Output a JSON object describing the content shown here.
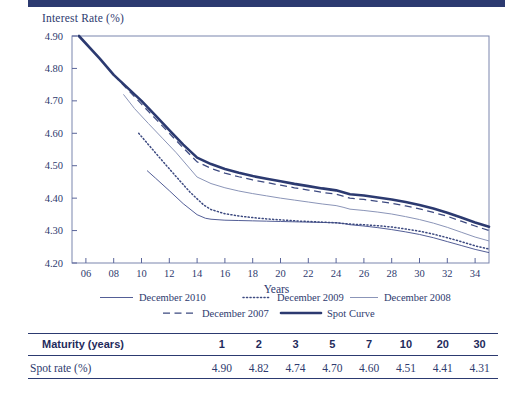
{
  "chart_data": {
    "type": "line",
    "title": "",
    "xlabel": "Years",
    "ylabel": "Interest Rate (%)",
    "xlim": [
      5,
      35
    ],
    "ylim": [
      4.2,
      4.9
    ],
    "grid": false,
    "legend_position": "bottom",
    "xticks": [
      "06",
      "08",
      "10",
      "12",
      "14",
      "16",
      "18",
      "20",
      "22",
      "24",
      "26",
      "28",
      "30",
      "32",
      "34"
    ],
    "xtick_values": [
      6,
      8,
      10,
      12,
      14,
      16,
      18,
      20,
      22,
      24,
      26,
      28,
      30,
      32,
      34
    ],
    "yticks": [
      "4.20",
      "4.30",
      "4.40",
      "4.50",
      "4.60",
      "4.70",
      "4.80",
      "4.90"
    ],
    "ytick_values": [
      4.2,
      4.3,
      4.4,
      4.5,
      4.6,
      4.7,
      4.8,
      4.9
    ],
    "series": [
      {
        "name": "Spot Curve",
        "style": "solid-thick",
        "color": "#2c3a70",
        "x": [
          5.5,
          7,
          8,
          9,
          10,
          11,
          12,
          13,
          14,
          15,
          16,
          17,
          18,
          19,
          20,
          21,
          22,
          23,
          24,
          24.5,
          25,
          26,
          27,
          28,
          29,
          30,
          31,
          32,
          33,
          34,
          35
        ],
        "y": [
          4.9,
          4.83,
          4.78,
          4.74,
          4.7,
          4.655,
          4.61,
          4.565,
          4.525,
          4.505,
          4.49,
          4.478,
          4.468,
          4.46,
          4.452,
          4.444,
          4.437,
          4.43,
          4.424,
          4.418,
          4.412,
          4.408,
          4.402,
          4.396,
          4.388,
          4.379,
          4.368,
          4.355,
          4.34,
          4.325,
          4.312
        ]
      },
      {
        "name": "December 2007",
        "style": "dashed",
        "color": "#3d4a80",
        "x": [
          8,
          9,
          10,
          11,
          12,
          13,
          14,
          15,
          16,
          17,
          18,
          19,
          20,
          21,
          22,
          23,
          24,
          24.5,
          25,
          26,
          27,
          28,
          29,
          30,
          31,
          32,
          33,
          34,
          35
        ],
        "y": [
          4.78,
          4.735,
          4.69,
          4.645,
          4.6,
          4.555,
          4.512,
          4.492,
          4.477,
          4.466,
          4.456,
          4.448,
          4.44,
          4.432,
          4.425,
          4.418,
          4.412,
          4.406,
          4.4,
          4.396,
          4.39,
          4.384,
          4.376,
          4.367,
          4.356,
          4.344,
          4.329,
          4.314,
          4.3
        ]
      },
      {
        "name": "December 2008",
        "style": "solid-thin-light",
        "color": "#8b95b8",
        "x": [
          8.7,
          9.5,
          10.5,
          11.5,
          12.5,
          13.5,
          14,
          15,
          16,
          17,
          18,
          19,
          20,
          21,
          22,
          23,
          24,
          24.5,
          25,
          26,
          27,
          28,
          29,
          30,
          31,
          32,
          33,
          34,
          35
        ],
        "y": [
          4.72,
          4.676,
          4.63,
          4.585,
          4.54,
          4.49,
          4.465,
          4.445,
          4.432,
          4.422,
          4.414,
          4.407,
          4.4,
          4.394,
          4.388,
          4.382,
          4.377,
          4.372,
          4.366,
          4.362,
          4.357,
          4.351,
          4.343,
          4.334,
          4.323,
          4.31,
          4.295,
          4.28,
          4.268
        ]
      },
      {
        "name": "December 2009",
        "style": "dotted",
        "color": "#3d4a80",
        "x": [
          9.8,
          10.5,
          11.5,
          12.5,
          13.5,
          14.5,
          15,
          16,
          17,
          18,
          19,
          20,
          21,
          22,
          23,
          24,
          24.5,
          25,
          26,
          27,
          28,
          29,
          30,
          31,
          32,
          33,
          34,
          35
        ],
        "y": [
          4.6,
          4.565,
          4.515,
          4.466,
          4.418,
          4.378,
          4.365,
          4.352,
          4.345,
          4.34,
          4.336,
          4.333,
          4.33,
          4.328,
          4.326,
          4.324,
          4.322,
          4.32,
          4.318,
          4.315,
          4.311,
          4.305,
          4.298,
          4.289,
          4.278,
          4.266,
          4.253,
          4.243
        ]
      },
      {
        "name": "December 2010",
        "style": "solid-thin",
        "color": "#4a5590",
        "x": [
          10.4,
          11,
          12,
          13,
          14,
          14.6,
          15,
          16,
          17,
          18,
          19,
          20,
          21,
          22,
          23,
          24,
          24.5,
          25,
          26,
          27,
          28,
          29,
          30,
          31,
          32,
          33,
          34,
          35
        ],
        "y": [
          4.485,
          4.462,
          4.423,
          4.383,
          4.349,
          4.338,
          4.335,
          4.332,
          4.331,
          4.33,
          4.329,
          4.328,
          4.327,
          4.326,
          4.325,
          4.324,
          4.322,
          4.318,
          4.314,
          4.309,
          4.303,
          4.296,
          4.288,
          4.278,
          4.266,
          4.254,
          4.242,
          4.232
        ]
      }
    ],
    "legend": [
      {
        "label": "December 2010",
        "style": "solid-thin"
      },
      {
        "label": "December 2009",
        "style": "dotted"
      },
      {
        "label": "December 2008",
        "style": "solid-thin-light"
      },
      {
        "label": "December 2007",
        "style": "dashed"
      },
      {
        "label": "Spot Curve",
        "style": "solid-thick"
      }
    ]
  },
  "table": {
    "header_label": "Maturity (years)",
    "row_label": "Spot rate (%)",
    "maturities": [
      "1",
      "2",
      "3",
      "5",
      "7",
      "10",
      "20",
      "30"
    ],
    "spot_rates": [
      "4.90",
      "4.82",
      "4.74",
      "4.70",
      "4.60",
      "4.51",
      "4.41",
      "4.31"
    ]
  },
  "colors": {
    "ink": "#2e3a6e",
    "rule": "#2c3a70",
    "light_line": "#8b95b8"
  }
}
